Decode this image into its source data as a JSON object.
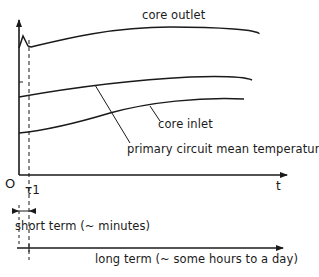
{
  "diagram": {
    "type": "temperature-vs-time schematic",
    "curves": [
      {
        "id": "core_outlet",
        "label": "core outlet"
      },
      {
        "id": "primary_mean",
        "label": "primary circuit mean temperature"
      },
      {
        "id": "core_inlet",
        "label": "core inlet"
      }
    ],
    "axes": {
      "origin_label": "O",
      "x_label": "t",
      "t1_label": "τ1"
    },
    "time_scales": {
      "short_term": "short term (~ minutes)",
      "long_term": "long term (~ some hours to a day)"
    },
    "colors": {
      "ink": "#1a1a1a",
      "background": "#ffffff"
    }
  }
}
